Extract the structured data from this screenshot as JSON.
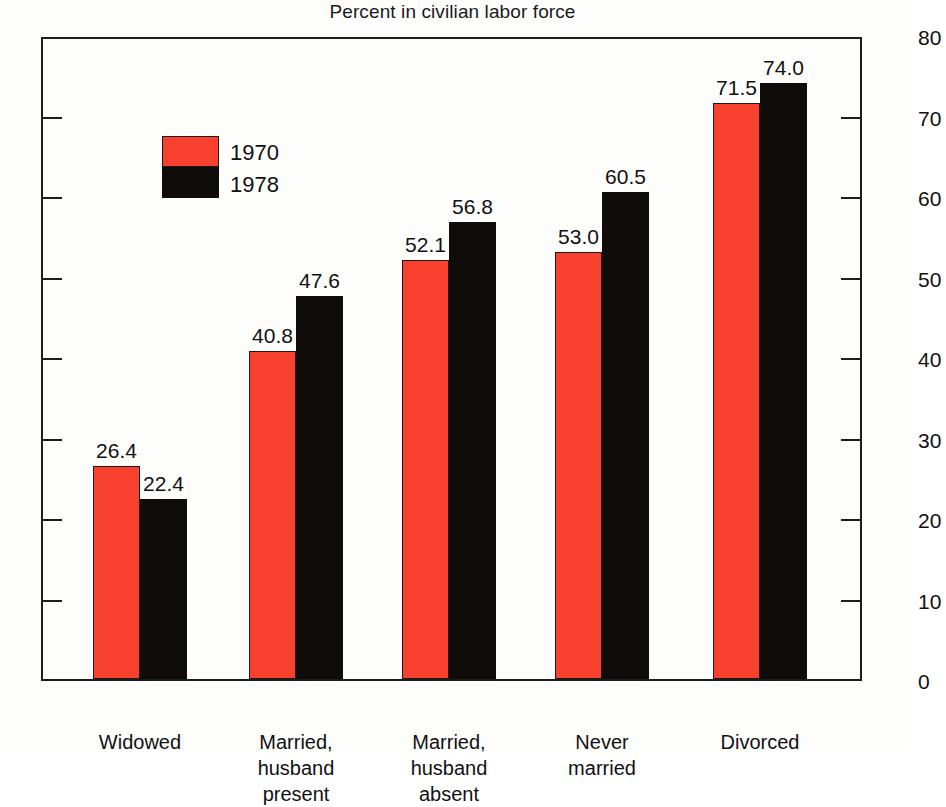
{
  "chart_data": {
    "type": "bar",
    "title": "Percent in civilian labor force",
    "xlabel": "",
    "ylabel": "",
    "ylim": [
      0,
      80
    ],
    "yticks": [
      0,
      10,
      20,
      30,
      40,
      50,
      60,
      70,
      80
    ],
    "grid": false,
    "legend_position": "upper-left-inside",
    "dual_y_axis": true,
    "categories": [
      "Widowed",
      "Married, husband present",
      "Married, husband absent",
      "Never married",
      "Divorced"
    ],
    "category_lines": [
      [
        "Widowed"
      ],
      [
        "Married,",
        "husband",
        "present"
      ],
      [
        "Married,",
        "husband",
        "absent"
      ],
      [
        "Never",
        "married"
      ],
      [
        "Divorced"
      ]
    ],
    "series": [
      {
        "name": "1970",
        "color": "#f8402e",
        "values": [
          26.4,
          40.8,
          52.1,
          53.0,
          71.5
        ],
        "labels": [
          "26.4",
          "40.8",
          "52.1",
          "53.0",
          "71.5"
        ]
      },
      {
        "name": "1978",
        "color": "#100c0a",
        "values": [
          22.4,
          47.6,
          56.8,
          60.5,
          74.0
        ],
        "labels": [
          "22.4",
          "47.6",
          "56.8",
          "60.5",
          "74.0"
        ]
      }
    ]
  },
  "axis": {
    "left_ticks": [
      "80",
      "70",
      "60",
      "50",
      "40",
      "30",
      "20",
      "10",
      "0"
    ],
    "right_ticks": [
      "80",
      "70",
      "60",
      "50",
      "40",
      "30",
      "20",
      "10",
      "0"
    ]
  },
  "legend": {
    "items": [
      {
        "label": "1970",
        "color": "#f8402e"
      },
      {
        "label": "1978",
        "color": "#100c0a"
      }
    ]
  }
}
